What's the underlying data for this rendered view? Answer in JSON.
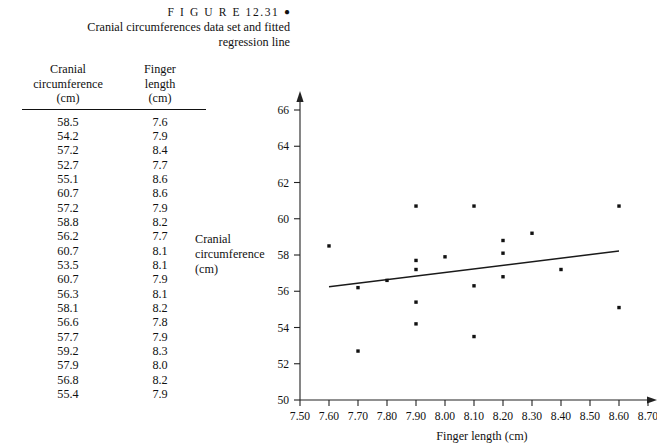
{
  "caption": {
    "figure_word": "F I G U R E",
    "figure_number": "12.31",
    "bullet": "●",
    "line1": "Cranial circumferences data set and fitted",
    "line2": "regression line"
  },
  "table": {
    "columns": [
      {
        "l1": "Cranial",
        "l2": "circumference",
        "l3": "(cm)"
      },
      {
        "l1": "Finger",
        "l2": "length",
        "l3": "(cm)"
      }
    ],
    "rows": [
      [
        "58.5",
        "7.6"
      ],
      [
        "54.2",
        "7.9"
      ],
      [
        "57.2",
        "8.4"
      ],
      [
        "52.7",
        "7.7"
      ],
      [
        "55.1",
        "8.6"
      ],
      [
        "60.7",
        "8.6"
      ],
      [
        "57.2",
        "7.9"
      ],
      [
        "58.8",
        "8.2"
      ],
      [
        "56.2",
        "7.7"
      ],
      [
        "60.7",
        "8.1"
      ],
      [
        "53.5",
        "8.1"
      ],
      [
        "60.7",
        "7.9"
      ],
      [
        "56.3",
        "8.1"
      ],
      [
        "58.1",
        "8.2"
      ],
      [
        "56.6",
        "7.8"
      ],
      [
        "57.7",
        "7.9"
      ],
      [
        "59.2",
        "8.3"
      ],
      [
        "57.9",
        "8.0"
      ],
      [
        "56.8",
        "8.2"
      ],
      [
        "55.4",
        "7.9"
      ]
    ]
  },
  "chart_data": {
    "type": "scatter",
    "title": "",
    "xlabel": "Finger length (cm)",
    "ylabel": "Cranial circumference (cm)",
    "ylabel_lines": [
      "Cranial",
      "circumference",
      "(cm)"
    ],
    "xlim": [
      7.5,
      8.7
    ],
    "ylim": [
      50,
      66
    ],
    "xticks": [
      "7.50",
      "7.60",
      "7.70",
      "7.80",
      "7.90",
      "8.00",
      "8.10",
      "8.20",
      "8.30",
      "8.40",
      "8.50",
      "8.60",
      "8.70"
    ],
    "xtick_values": [
      7.5,
      7.6,
      7.7,
      7.8,
      7.9,
      8.0,
      8.1,
      8.2,
      8.3,
      8.4,
      8.5,
      8.6,
      8.7
    ],
    "yticks": [
      "50",
      "52",
      "54",
      "56",
      "58",
      "60",
      "62",
      "64",
      "66"
    ],
    "ytick_values": [
      50,
      52,
      54,
      56,
      58,
      60,
      62,
      64,
      66
    ],
    "grid": false,
    "legend": null,
    "point_color": "#111111",
    "line_color": "#1a1a1a",
    "axis_color": "#222222",
    "points": [
      {
        "x": 7.6,
        "y": 58.5
      },
      {
        "x": 7.9,
        "y": 54.2
      },
      {
        "x": 8.4,
        "y": 57.2
      },
      {
        "x": 7.7,
        "y": 52.7
      },
      {
        "x": 8.6,
        "y": 55.1
      },
      {
        "x": 8.6,
        "y": 60.7
      },
      {
        "x": 7.9,
        "y": 57.2
      },
      {
        "x": 8.2,
        "y": 58.8
      },
      {
        "x": 7.7,
        "y": 56.2
      },
      {
        "x": 8.1,
        "y": 60.7
      },
      {
        "x": 8.1,
        "y": 53.5
      },
      {
        "x": 7.9,
        "y": 60.7
      },
      {
        "x": 8.1,
        "y": 56.3
      },
      {
        "x": 8.2,
        "y": 58.1
      },
      {
        "x": 7.8,
        "y": 56.6
      },
      {
        "x": 7.9,
        "y": 57.7
      },
      {
        "x": 8.3,
        "y": 59.2
      },
      {
        "x": 8.0,
        "y": 57.9
      },
      {
        "x": 8.2,
        "y": 56.8
      },
      {
        "x": 7.9,
        "y": 55.4
      }
    ],
    "fit_line": {
      "x1": 7.6,
      "y1": 56.25,
      "x2": 8.6,
      "y2": 58.22
    }
  }
}
